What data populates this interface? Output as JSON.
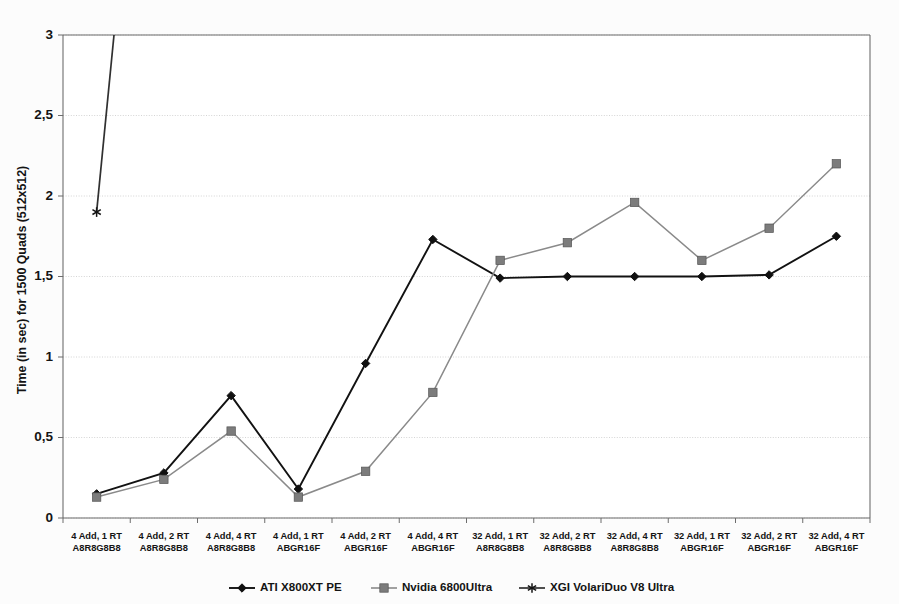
{
  "chart_data": {
    "type": "line",
    "title": "",
    "xlabel": "",
    "ylabel": "Time (in sec) for 1500 Quads (512x512)",
    "ylim": [
      0,
      3
    ],
    "yticks": [
      0,
      0.5,
      1,
      1.5,
      2,
      2.5,
      3
    ],
    "ytick_labels": [
      "0",
      "0,5",
      "1",
      "1,5",
      "2",
      "2,5",
      "3"
    ],
    "grid": true,
    "legend_position": "bottom",
    "categories": [
      "4 Add, 1 RT\nA8R8G8B8",
      "4 Add, 2 RT\nA8R8G8B8",
      "4 Add, 4 RT\nA8R8G8B8",
      "4 Add, 1 RT\nABGR16F",
      "4 Add, 2 RT\nABGR16F",
      "4 Add, 4 RT\nABGR16F",
      "32 Add, 1 RT\nA8R8G8B8",
      "32 Add, 2 RT\nA8R8G8B8",
      "32 Add, 4 RT\nA8R8G8B8",
      "32 Add, 1 RT\nABGR16F",
      "32 Add, 2 RT\nABGR16F",
      "32 Add, 4 RT\nABGR16F"
    ],
    "category_lines": [
      [
        "4 Add, 1 RT",
        "A8R8G8B8"
      ],
      [
        "4 Add, 2 RT",
        "A8R8G8B8"
      ],
      [
        "4 Add, 4 RT",
        "A8R8G8B8"
      ],
      [
        "4 Add, 1 RT",
        "ABGR16F"
      ],
      [
        "4 Add, 2 RT",
        "ABGR16F"
      ],
      [
        "4 Add, 4 RT",
        "ABGR16F"
      ],
      [
        "32 Add, 1 RT",
        "A8R8G8B8"
      ],
      [
        "32 Add, 2 RT",
        "A8R8G8B8"
      ],
      [
        "32 Add, 4 RT",
        "A8R8G8B8"
      ],
      [
        "32 Add, 1 RT",
        "ABGR16F"
      ],
      [
        "32 Add, 2 RT",
        "ABGR16F"
      ],
      [
        "32 Add, 4 RT",
        "ABGR16F"
      ]
    ],
    "series": [
      {
        "name": "ATI X800XT PE",
        "marker": "diamond",
        "color": "#121212",
        "values": [
          0.15,
          0.28,
          0.76,
          0.18,
          0.96,
          1.73,
          1.49,
          1.5,
          1.5,
          1.5,
          1.51,
          1.75
        ]
      },
      {
        "name": "Nvidia 6800Ultra",
        "marker": "square",
        "color": "#8a8a8a",
        "values": [
          0.13,
          0.24,
          0.54,
          0.13,
          0.29,
          0.78,
          1.6,
          1.71,
          1.96,
          1.6,
          1.8,
          2.2
        ]
      },
      {
        "name": "XGI VolariDuo V8 Ultra",
        "marker": "star",
        "color": "#303030",
        "values": [
          1.9,
          null,
          null,
          null,
          null,
          null,
          null,
          null,
          null,
          null,
          null,
          null
        ],
        "note": "Series exits top of plot between category 1 and 2; only first point visible."
      }
    ]
  },
  "legend": {
    "items": [
      {
        "label": "ATI X800XT PE",
        "marker": "diamond"
      },
      {
        "label": "Nvidia 6800Ultra",
        "marker": "square"
      },
      {
        "label": "XGI VolariDuo V8 Ultra",
        "marker": "star"
      }
    ]
  }
}
